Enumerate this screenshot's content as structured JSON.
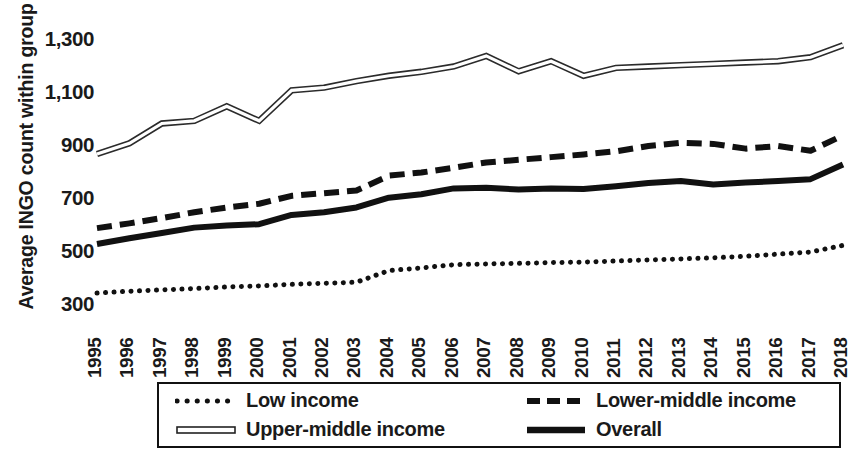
{
  "chart_data": {
    "type": "line",
    "title": "",
    "xlabel": "",
    "ylabel": "Average INGO count within group",
    "x": [
      1995,
      1996,
      1997,
      1998,
      1999,
      2000,
      2001,
      2002,
      2003,
      2004,
      2005,
      2006,
      2007,
      2008,
      2009,
      2010,
      2011,
      2012,
      2013,
      2014,
      2015,
      2016,
      2017,
      2018
    ],
    "xtick_labels": [
      "1995",
      "1996",
      "1997",
      "1998",
      "1999",
      "2000",
      "2001",
      "2002",
      "2003",
      "2004",
      "2005",
      "2006",
      "2007",
      "2008",
      "2009",
      "2010",
      "2011",
      "2012",
      "2013",
      "2014",
      "2015",
      "2016",
      "2017",
      "2018"
    ],
    "ytick_labels": [
      "300",
      "500",
      "700",
      "900",
      "1,100",
      "1,300"
    ],
    "ytick_values": [
      300,
      500,
      700,
      900,
      1100,
      1300
    ],
    "ylim": [
      290,
      1330
    ],
    "xlim": [
      1995,
      2018
    ],
    "grid": false,
    "legend_position": "bottom",
    "series": [
      {
        "name": "Low income",
        "style": "dotted",
        "color": "#111111",
        "values": [
          345,
          352,
          357,
          362,
          368,
          372,
          378,
          382,
          386,
          430,
          440,
          452,
          455,
          457,
          460,
          462,
          466,
          470,
          474,
          478,
          484,
          492,
          500,
          525
        ]
      },
      {
        "name": "Lower-middle income",
        "style": "dashed",
        "color": "#111111",
        "values": [
          590,
          608,
          628,
          650,
          668,
          682,
          712,
          722,
          732,
          788,
          800,
          818,
          838,
          848,
          858,
          868,
          880,
          900,
          912,
          908,
          890,
          900,
          882,
          940
        ]
      },
      {
        "name": "Upper-middle income",
        "style": "double",
        "color": "#333333",
        "values": [
          870,
          910,
          985,
          995,
          1050,
          995,
          1110,
          1120,
          1145,
          1165,
          1180,
          1200,
          1240,
          1182,
          1220,
          1165,
          1195,
          1200,
          1205,
          1210,
          1215,
          1220,
          1235,
          1280
        ]
      },
      {
        "name": "Overall",
        "style": "solid",
        "color": "#111111",
        "values": [
          530,
          552,
          572,
          592,
          600,
          605,
          640,
          650,
          668,
          705,
          718,
          740,
          742,
          736,
          740,
          738,
          748,
          760,
          768,
          755,
          762,
          768,
          775,
          830
        ]
      }
    ]
  },
  "legend": {
    "items": [
      {
        "label": "Low income",
        "style": "dotted"
      },
      {
        "label": "Lower-middle income",
        "style": "dashed"
      },
      {
        "label": "Upper-middle income",
        "style": "double"
      },
      {
        "label": "Overall",
        "style": "solid"
      }
    ]
  }
}
